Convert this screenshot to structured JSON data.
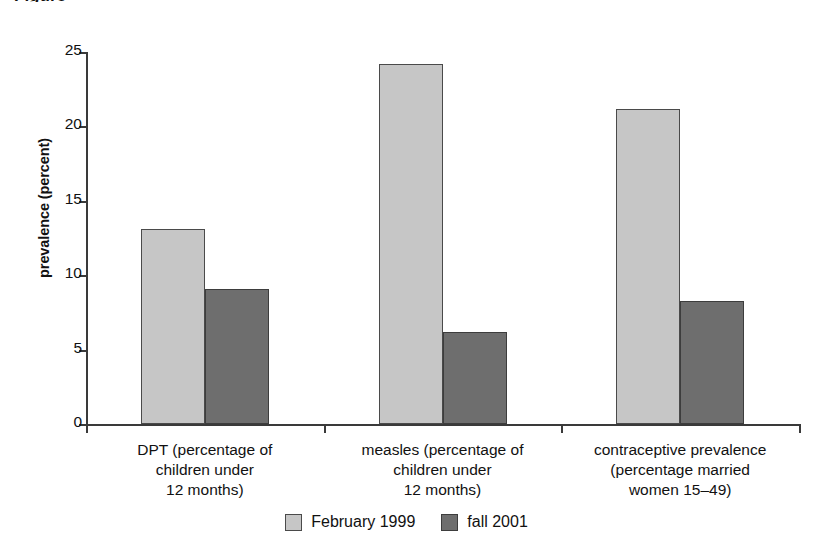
{
  "figure": {
    "title_fragment": "Figure",
    "legend_position": "bottom-center"
  },
  "chart_data": {
    "type": "bar",
    "title": "",
    "xlabel": "",
    "ylabel": "prevalence (percent)",
    "ylim": [
      0,
      25
    ],
    "yticks": [
      "0",
      "5",
      "10",
      "15",
      "20",
      "25"
    ],
    "ytick_values": [
      0,
      5,
      10,
      15,
      20,
      25
    ],
    "grid": false,
    "categories": [
      "DPT (percentage of\nchildren under\n12 months)",
      "measles (percentage of\nchildren under\n12 months)",
      "contraceptive prevalence\n(percentage married\nwomen 15–49)"
    ],
    "category_lines": [
      [
        "DPT (percentage of",
        "children under",
        "12 months)"
      ],
      [
        "measles (percentage of",
        "children under",
        "12 months)"
      ],
      [
        "contraceptive prevalence",
        "(percentage married",
        "women 15–49)"
      ]
    ],
    "series": [
      {
        "name": "February 1999",
        "color": "#c6c6c6",
        "values": [
          13.1,
          24.2,
          21.2
        ]
      },
      {
        "name": "fall 2001",
        "color": "#6e6e6e",
        "values": [
          9.1,
          6.2,
          8.3
        ]
      }
    ],
    "legend": [
      "February 1999",
      "fall 2001"
    ]
  }
}
